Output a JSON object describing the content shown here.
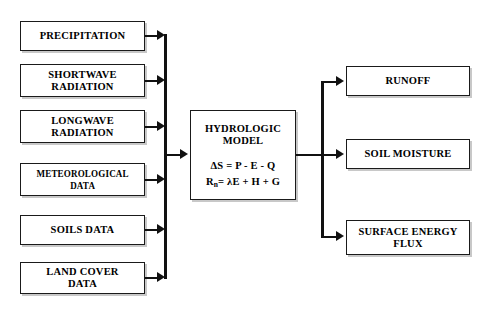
{
  "diagram": {
    "inputs": [
      {
        "id": "precipitation",
        "label": "PRECIPITATION"
      },
      {
        "id": "shortwave",
        "label": "SHORTWAVE\nRADIATION"
      },
      {
        "id": "longwave",
        "label": "LONGWAVE\nRADIATION"
      },
      {
        "id": "meteorological",
        "label": "METEOROLOGICAL\nDATA"
      },
      {
        "id": "soils-data",
        "label": "SOILS DATA"
      },
      {
        "id": "land-cover",
        "label": "LAND COVER\nDATA"
      }
    ],
    "model": {
      "title": "HYDROLOGIC\nMODEL",
      "equation_mass": "ΔS = P - E - Q",
      "equation_energy_lead": "R",
      "equation_energy_sub": "n",
      "equation_energy_rest": "= λE + H + G"
    },
    "outputs": [
      {
        "id": "runoff",
        "label": "RUNOFF"
      },
      {
        "id": "soil-moisture",
        "label": "SOIL MOISTURE"
      },
      {
        "id": "surface-energy",
        "label": "SURFACE ENERGY\nFLUX"
      }
    ],
    "colors": {
      "line": "#111111",
      "box_border": "#1a1a1a",
      "box_shadow": "#c8c8c8",
      "background": "#ffffff",
      "text": "#000000"
    }
  }
}
